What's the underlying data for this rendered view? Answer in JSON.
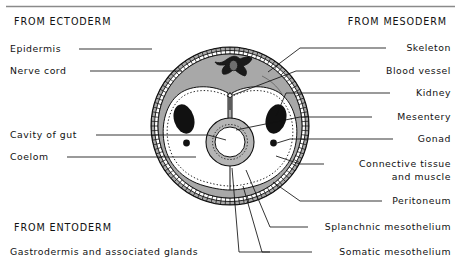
{
  "figure": {
    "top_rule": true,
    "germ_layer_headings": [
      {
        "id": "ectoderm",
        "text": "FROM ECTODERM",
        "x": 14,
        "y": 22,
        "anchor": "start"
      },
      {
        "id": "mesoderm",
        "text": "FROM MESODERM",
        "x": 447,
        "y": 22,
        "anchor": "end"
      },
      {
        "id": "entoderm",
        "text": "FROM ENTODERM",
        "x": 14,
        "y": 228,
        "anchor": "start"
      }
    ],
    "labels": [
      {
        "id": "epidermis",
        "text": "Epidermis",
        "x": 10,
        "y": 49,
        "anchor": "start",
        "side": "left"
      },
      {
        "id": "nerve-cord",
        "text": "Nerve cord",
        "x": 10,
        "y": 71,
        "anchor": "start",
        "side": "left"
      },
      {
        "id": "cavity-of-gut",
        "text": "Cavity of gut",
        "x": 10,
        "y": 135,
        "anchor": "start",
        "side": "left"
      },
      {
        "id": "coelom",
        "text": "Coelom",
        "x": 10,
        "y": 157,
        "anchor": "start",
        "side": "left"
      },
      {
        "id": "gastrodermis",
        "text": "Gastrodermis and associated glands",
        "x": 10,
        "y": 252,
        "anchor": "start",
        "side": "left"
      },
      {
        "id": "skeleton",
        "text": "Skeleton",
        "x": 451,
        "y": 48,
        "anchor": "end",
        "side": "right"
      },
      {
        "id": "blood-vessel",
        "text": "Blood vessel",
        "x": 451,
        "y": 71,
        "anchor": "end",
        "side": "right"
      },
      {
        "id": "kidney",
        "text": "Kidney",
        "x": 451,
        "y": 93,
        "anchor": "end",
        "side": "right"
      },
      {
        "id": "mesentery",
        "text": "Mesentery",
        "x": 451,
        "y": 117,
        "anchor": "end",
        "side": "right"
      },
      {
        "id": "gonad",
        "text": "Gonad",
        "x": 451,
        "y": 139,
        "anchor": "end",
        "side": "right"
      },
      {
        "id": "connective-tissue",
        "text": "Connective tissue",
        "x": 451,
        "y": 164,
        "anchor": "end",
        "side": "right"
      },
      {
        "id": "connective-tissue-2",
        "text": "and muscle",
        "x": 451,
        "y": 177,
        "anchor": "end",
        "side": "right"
      },
      {
        "id": "peritoneum",
        "text": "Peritoneum",
        "x": 451,
        "y": 201,
        "anchor": "end",
        "side": "right"
      },
      {
        "id": "splanchnic-mesothelium",
        "text": "Splanchnic mesothelium",
        "x": 451,
        "y": 227,
        "anchor": "end",
        "side": "right"
      },
      {
        "id": "somatic-mesothelium",
        "text": "Somatic mesothelium",
        "x": 451,
        "y": 252,
        "anchor": "end",
        "side": "right"
      }
    ],
    "anatomy": {
      "body_center_x": 230,
      "body_center_y": 126,
      "body_radius": 79,
      "structures": [
        "epidermis-ring",
        "connective-tissue-muscle",
        "nerve-cord",
        "dorsal-blood-vessel",
        "coelom-left",
        "coelom-right",
        "kidney-left",
        "kidney-right",
        "gonad-left",
        "gonad-right",
        "dorsal-mesentery",
        "ventral-mesentery",
        "gut-wall",
        "gut-cavity"
      ]
    },
    "colors": {
      "ink": "#111111",
      "body_wall_fill": "#a8a8a8",
      "coelom_fill": "#ffffff",
      "gut_wall_fill": "#b5b5b5",
      "gut_cavity_fill": "#ffffff",
      "dark_organ_fill": "#111111",
      "rule": "#8a8a8a",
      "page_background": "#ffffff"
    }
  }
}
